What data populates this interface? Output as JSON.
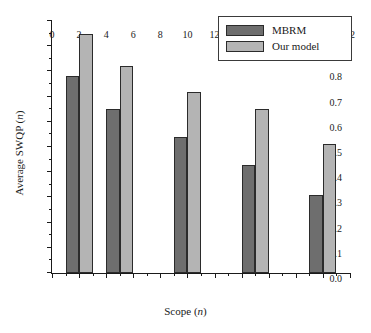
{
  "chart_data": {
    "type": "bar",
    "title": "",
    "xlabel": "Scope (n)",
    "ylabel": "Average SWQP (n)",
    "xlabel_plain": "Scope",
    "xlabel_italic": "n",
    "ylabel_plain": "Average SWQP",
    "ylabel_italic": "n",
    "categories": [
      2,
      5,
      10,
      15,
      20
    ],
    "x": [
      2,
      5,
      10,
      15,
      20
    ],
    "series": [
      {
        "name": "MBRM",
        "color": "#6e6e6e",
        "values": [
          0.78,
          0.65,
          0.54,
          0.43,
          0.31
        ]
      },
      {
        "name": "Our model",
        "color": "#b4b4b4",
        "values": [
          0.95,
          0.82,
          0.72,
          0.65,
          0.51
        ]
      }
    ],
    "xlim": [
      0,
      22
    ],
    "ylim": [
      0.0,
      1.0
    ],
    "xticks": [
      0,
      2,
      4,
      6,
      8,
      10,
      12,
      14,
      16,
      18,
      20,
      22
    ],
    "xtick_labels": [
      "0",
      "2",
      "4",
      "6",
      "8",
      "10",
      "12",
      "14",
      "16",
      "18",
      "20",
      "22"
    ],
    "yticks": [
      0.0,
      0.1,
      0.2,
      0.3,
      0.4,
      0.5,
      0.6,
      0.7,
      0.8,
      0.9,
      1.0
    ],
    "ytick_labels": [
      "0.0",
      "0.1",
      "0.2",
      "0.3",
      "0.4",
      "0.5",
      "0.6",
      "0.7",
      "0.8",
      "0.9",
      "1.0"
    ],
    "bar_width_units": 1,
    "bar_left_edges": {
      "MBRM": [
        1,
        4,
        9,
        14,
        19
      ],
      "Our model": [
        2,
        5,
        10,
        15,
        20
      ]
    },
    "grid": false,
    "legend_position": "top-right",
    "minor_ticks": true,
    "spines": [
      "left",
      "bottom"
    ]
  },
  "legend": {
    "entries": [
      {
        "label": "MBRM",
        "color": "#6e6e6e"
      },
      {
        "label": "Our model",
        "color": "#b4b4b4"
      }
    ]
  },
  "colors": {
    "mbrm": "#6e6e6e",
    "our_model": "#b4b4b4",
    "axis": "#1a1a1a",
    "bar_edge": "#2b2b2b",
    "background": "#ffffff"
  }
}
